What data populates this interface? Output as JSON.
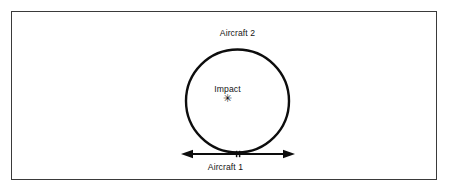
{
  "figure": {
    "background_color": "#ffffff",
    "frame": {
      "border_color": "#3a3a3a",
      "fill_color": "#ffffff"
    },
    "ink_color": "#141414",
    "labels": {
      "aircraft_2": "Aircraft 2",
      "impact": "Impact",
      "aircraft_1": "Aircraft 1",
      "impact_marker": "✳"
    },
    "geometry": {
      "circle": {
        "center_x": 237.5,
        "center_y": 101,
        "radius": 51.5,
        "stroke_width": 2.4,
        "stroke_color": "#0d0d0d"
      },
      "arrow": {
        "y": 154,
        "x_start": 181,
        "x_end": 295,
        "stroke_width": 1.8,
        "stroke_color": "#0d0d0d",
        "head_length": 11,
        "head_half_width": 4.2,
        "tick_x": 238,
        "tick_half_height": 3.2
      }
    }
  }
}
